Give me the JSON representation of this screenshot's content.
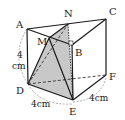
{
  "diagram": {
    "type": "triangular-prism",
    "colors": {
      "edge": "#1a1a1a",
      "hidden_edge": "#333333",
      "shade": "#c8c8c8",
      "arc": "#888888"
    },
    "vertices": {
      "A": {
        "label": "A",
        "x": 27,
        "y": 29
      },
      "N": {
        "label": "N",
        "x": 68,
        "y": 24
      },
      "C": {
        "label": "C",
        "x": 106,
        "y": 19
      },
      "B": {
        "label": "B",
        "x": 72,
        "y": 45
      },
      "M": {
        "label": "M",
        "x": 49,
        "y": 38
      },
      "D": {
        "label": "D",
        "x": 28,
        "y": 84
      },
      "E": {
        "label": "E",
        "x": 73,
        "y": 100
      },
      "F": {
        "label": "F",
        "x": 106,
        "y": 75
      }
    },
    "measurements": {
      "AD": "4 cm",
      "DE": "4cm",
      "EF": "4cm"
    },
    "labels": {
      "A": "A",
      "B": "B",
      "C": "C",
      "D": "D",
      "E": "E",
      "F": "F",
      "M": "M",
      "N": "N",
      "ad_num": "4",
      "ad_unit": "cm",
      "de": "4cm",
      "ef": "4cm"
    }
  }
}
